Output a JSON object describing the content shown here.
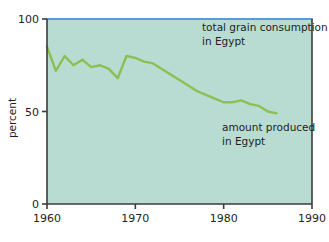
{
  "chart_data": {
    "type": "line",
    "title": "",
    "xlabel": "",
    "ylabel": "percent",
    "xlim": [
      1960,
      1990
    ],
    "ylim": [
      0,
      100
    ],
    "grid": false,
    "legend_position": "inline-annotations",
    "xticks": [
      "1960",
      "1970",
      "1980",
      "1990"
    ],
    "xtick_values": [
      1960,
      1970,
      1980,
      1990
    ],
    "yticks": [
      "0",
      "50",
      "100"
    ],
    "ytick_values": [
      0,
      50,
      100
    ],
    "colors": {
      "plot_background": "#b8dcd2",
      "consumption_line": "#5b9bd5",
      "production_line": "#8cbf54",
      "axis": "#3b3b3b",
      "text": "#231f20",
      "page_background": "#ffffff"
    },
    "series": [
      {
        "name": "total grain consumption in Egypt",
        "color": "#5b9bd5",
        "x": [
          1960,
          1990
        ],
        "values": [
          100,
          100
        ]
      },
      {
        "name": "amount produced in Egypt",
        "color": "#8cbf54",
        "x": [
          1960,
          1961,
          1962,
          1963,
          1964,
          1965,
          1966,
          1967,
          1968,
          1969,
          1970,
          1971,
          1972,
          1973,
          1974,
          1975,
          1976,
          1977,
          1978,
          1979,
          1980,
          1981,
          1982,
          1983,
          1984,
          1985,
          1986
        ],
        "values": [
          85,
          72,
          80,
          75,
          78,
          74,
          75,
          73,
          68,
          80,
          79,
          77,
          76,
          73,
          70,
          67,
          64,
          61,
          59,
          57,
          55,
          55,
          56,
          54,
          53,
          50,
          49
        ]
      }
    ],
    "annotations": [
      {
        "id": "consumption-annotation",
        "lines": [
          "total grain consumption",
          "in Egypt"
        ],
        "x": 1984,
        "y": 92
      },
      {
        "id": "production-annotation",
        "lines": [
          "amount produced",
          "in Egypt"
        ],
        "x": 1984,
        "y": 42
      }
    ]
  }
}
